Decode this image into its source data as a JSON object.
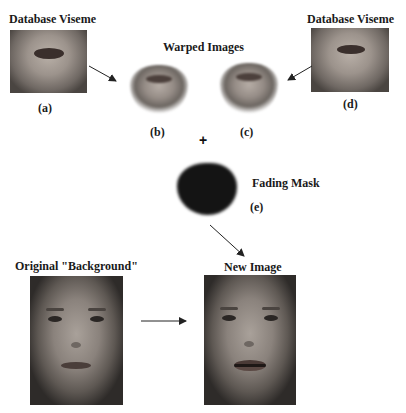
{
  "labels": {
    "database_viseme_left": "Database Viseme",
    "database_viseme_right": "Database Viseme",
    "warped_images": "Warped Images",
    "fading_mask": "Fading Mask",
    "original_background": "Original \"Background\"",
    "new_image": "New Image",
    "plus": "+"
  },
  "subfigures": {
    "a": "(a)",
    "b": "(b)",
    "c": "(c)",
    "d": "(d)",
    "e": "(e)"
  },
  "colors": {
    "background": "#ffffff",
    "text": "#1a1a1a",
    "arrow": "#222222",
    "mask": "#141414"
  }
}
